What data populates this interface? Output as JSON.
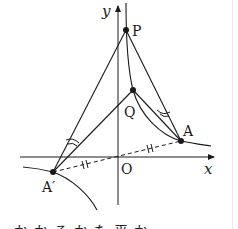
{
  "diagram": {
    "axes": {
      "x_label": "x",
      "y_label": "y",
      "origin_label": "O"
    },
    "points": {
      "P": {
        "label": "P",
        "x": 126,
        "y": 30
      },
      "Q": {
        "label": "Q",
        "x": 133,
        "y": 90
      },
      "A": {
        "label": "A",
        "x": 181,
        "y": 141
      },
      "A_prime": {
        "label": "A′",
        "x": 53,
        "y": 172
      }
    },
    "segments": [
      {
        "from": "P",
        "to": "A",
        "style": "solid"
      },
      {
        "from": "P",
        "to": "A_prime",
        "style": "solid"
      },
      {
        "from": "Q",
        "to": "A",
        "style": "solid"
      },
      {
        "from": "Q",
        "to": "A_prime",
        "style": "solid"
      },
      {
        "from": "A",
        "to": "A_prime",
        "style": "dashed",
        "through": "O"
      }
    ],
    "marks": {
      "equal_angles": [
        "angle PAQ",
        "angle PA′Q"
      ],
      "equal_lengths": [
        "OA",
        "OA′"
      ]
    },
    "curves": [
      "hyperbola branch through A",
      "hyperbola branch through A′",
      "curve P–Q–A"
    ],
    "bottom_text": "かかるかた平か"
  },
  "colors": {
    "ink": "#1a1a1a",
    "background": "#ffffff"
  }
}
